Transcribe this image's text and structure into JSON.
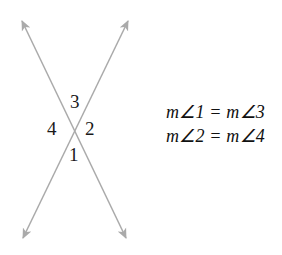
{
  "figure": {
    "name": "vertical-angles-diagram",
    "width": 282,
    "height": 255,
    "background_color": "#ffffff",
    "line_color": "#aaaaaa",
    "arrow_color": "#aaaaaa",
    "label_color": "#1a1a1a",
    "equation_color": "#111111"
  },
  "diagram": {
    "intersection": {
      "x": 74.5,
      "y": 129
    },
    "lines": [
      {
        "name": "line-upper-left-to-lower-right",
        "x1": 22,
        "y1": 21,
        "x2": 126,
        "y2": 238,
        "arrow_start": true,
        "arrow_end": true
      },
      {
        "name": "line-upper-right-to-lower-left",
        "x1": 128,
        "y1": 21,
        "x2": 23,
        "y2": 238,
        "arrow_start": true,
        "arrow_end": true
      }
    ],
    "arrowheads": [
      {
        "name": "arrowhead-top-left",
        "x": 22,
        "y": 21
      },
      {
        "name": "arrowhead-top-right",
        "x": 128,
        "y": 21
      },
      {
        "name": "arrowhead-bottom-left",
        "x": 23,
        "y": 238
      },
      {
        "name": "arrowhead-bottom-right",
        "x": 126,
        "y": 238
      }
    ],
    "angle_labels": [
      {
        "id": "3",
        "text": "3",
        "position": "top"
      },
      {
        "id": "4",
        "text": "4",
        "position": "left"
      },
      {
        "id": "2",
        "text": "2",
        "position": "right"
      },
      {
        "id": "1",
        "text": "1",
        "position": "bottom"
      }
    ]
  },
  "equations": {
    "line1": "m∠1 = m∠3",
    "line2": "m∠2 = m∠4"
  }
}
